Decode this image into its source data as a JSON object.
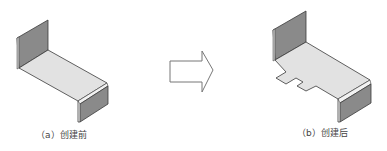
{
  "figures": [
    {
      "id": "a",
      "caption": "（a）创建前",
      "description": "Z-shaped sheet metal part before tab creation"
    },
    {
      "id": "b",
      "caption": "（b）创建后",
      "description": "Sheet metal part after creating a tab on the base flange"
    }
  ],
  "arrow": {
    "direction": "right",
    "meaning": "transform"
  },
  "colors": {
    "wall_dark": "#7a7a7a",
    "wall_mid": "#9a9a9a",
    "platform": "#e2e2e2",
    "edge": "#3a3a3a",
    "arrow_stroke": "#777777"
  }
}
